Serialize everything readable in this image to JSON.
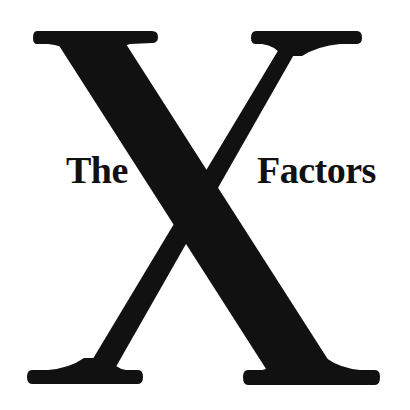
{
  "logo": {
    "left_word": "The",
    "center_letter": "X",
    "right_word": "Factors",
    "colors": {
      "ink": "#111111",
      "background": "#ffffff"
    }
  }
}
